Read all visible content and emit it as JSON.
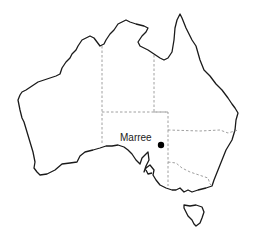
{
  "map": {
    "region": "Australia",
    "places": [
      {
        "name": "Marree",
        "marker": "filled-circle"
      }
    ],
    "colors": {
      "coastline": "#1a1a1a",
      "state_borders": "#888888",
      "marker": "#000000",
      "background": "#ffffff"
    }
  }
}
